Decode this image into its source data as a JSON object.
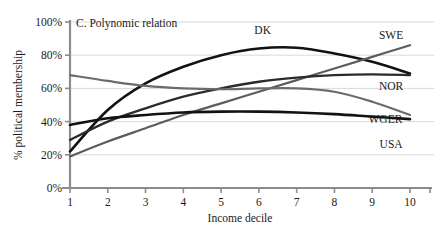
{
  "chart_data": {
    "type": "line",
    "title": "C. Polynomic relation",
    "xlabel": "Income decile",
    "ylabel": "% political membership",
    "x": [
      1,
      2,
      3,
      4,
      5,
      6,
      7,
      8,
      9,
      10
    ],
    "xlim": [
      1,
      10
    ],
    "ylim": [
      0,
      100
    ],
    "ytick_labels": [
      "0%",
      "20%",
      "40%",
      "60%",
      "80%",
      "100%"
    ],
    "ytick_values": [
      0,
      20,
      40,
      60,
      80,
      100
    ],
    "xtick_labels": [
      "1",
      "2",
      "3",
      "4",
      "5",
      "6",
      "7",
      "8",
      "9",
      "10"
    ],
    "grid": true,
    "legend_position": "inline-end-of-line",
    "series": [
      {
        "name": "DK",
        "label": "DK",
        "color": "#121212",
        "width": 2.6,
        "values": [
          22,
          47,
          63,
          73,
          80,
          84,
          84.5,
          81,
          76,
          69
        ],
        "label_x": 6.1,
        "label_y": 93
      },
      {
        "name": "SWE",
        "label": "SWE",
        "color": "#5c5c5c",
        "width": 2.2,
        "values": [
          19,
          28,
          36,
          44,
          51,
          58,
          65,
          72,
          79,
          86
        ],
        "label_x": 9.5,
        "label_y": 90
      },
      {
        "name": "NOR",
        "label": "NOR",
        "color": "#2b2b2b",
        "width": 2.3,
        "values": [
          29,
          40,
          48,
          55,
          60,
          64,
          66.5,
          68,
          68.5,
          68
        ],
        "label_x": 9.5,
        "label_y": 59
      },
      {
        "name": "WGER",
        "label": "WGER",
        "color": "#121212",
        "width": 2.6,
        "values": [
          38,
          42,
          44,
          45.5,
          46,
          46,
          45.5,
          44.5,
          43,
          41.5
        ],
        "label_x": 9.35,
        "label_y": 39
      },
      {
        "name": "USA",
        "label": "USA",
        "color": "#6b6b6b",
        "width": 2.2,
        "values": [
          68,
          64.5,
          61.5,
          60,
          59.5,
          60,
          60,
          58,
          52,
          44
        ],
        "label_x": 9.5,
        "label_y": 24
      }
    ]
  }
}
